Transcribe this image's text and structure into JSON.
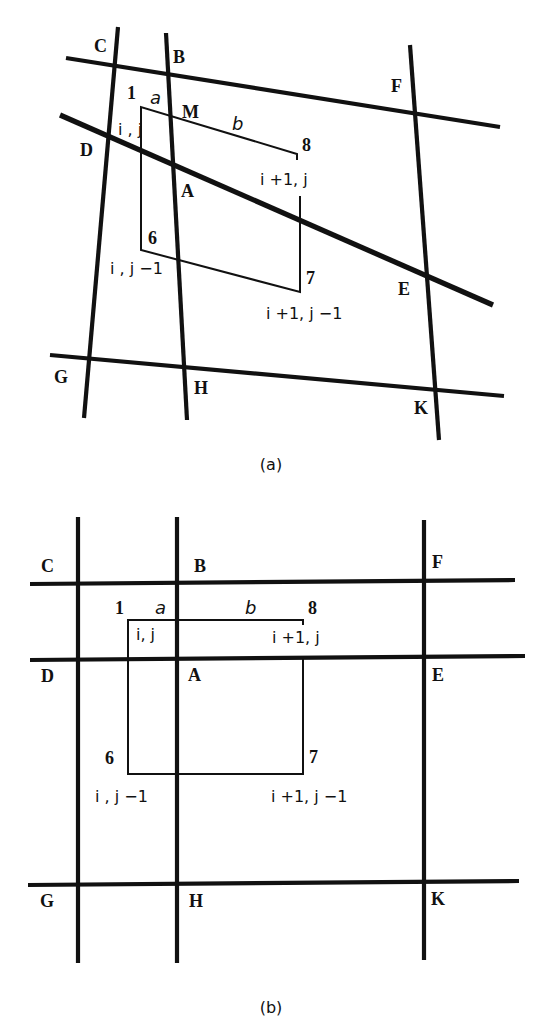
{
  "panels": [
    {
      "id": "a",
      "caption": "(a)",
      "caption_pos": [
        271,
        470
      ],
      "heavy_lines": [
        {
          "name": "grid-line-CD-vertical",
          "x1": 118,
          "y1": 27,
          "x2": 84,
          "y2": 418
        },
        {
          "name": "grid-line-BAH-vertical",
          "x1": 166,
          "y1": 33,
          "x2": 187,
          "y2": 420
        },
        {
          "name": "grid-line-FEK-vertical",
          "x1": 410,
          "y1": 45,
          "x2": 439,
          "y2": 440
        },
        {
          "name": "grid-line-CBF-horizontal",
          "x1": 66,
          "y1": 58,
          "x2": 500,
          "y2": 127
        },
        {
          "name": "grid-line-DAE-horizontal",
          "x1": 60,
          "y1": 115,
          "x2": 493,
          "y2": 305,
          "thick": true
        },
        {
          "name": "grid-line-GHK-horizontal",
          "x1": 50,
          "y1": 355,
          "x2": 504,
          "y2": 396
        }
      ],
      "thin_polyline": [
        [
          141,
          142
        ],
        [
          141,
          107
        ],
        [
          297,
          154
        ],
        [
          297,
          160
        ]
      ],
      "thin_polyline_2": [
        [
          141,
          142
        ],
        [
          141,
          250
        ],
        [
          300,
          292
        ],
        [
          300,
          196
        ]
      ],
      "point_labels": [
        {
          "text": "C",
          "x": 94,
          "y": 52
        },
        {
          "text": "B",
          "x": 173,
          "y": 63
        },
        {
          "text": "F",
          "x": 391,
          "y": 92
        },
        {
          "text": "M",
          "x": 182,
          "y": 118
        },
        {
          "text": "D",
          "x": 80,
          "y": 156
        },
        {
          "text": "A",
          "x": 181,
          "y": 197
        },
        {
          "text": "E",
          "x": 398,
          "y": 295
        },
        {
          "text": "G",
          "x": 54,
          "y": 383
        },
        {
          "text": "H",
          "x": 194,
          "y": 394
        },
        {
          "text": "K",
          "x": 414,
          "y": 414
        }
      ],
      "node_numbers": [
        {
          "text": "1",
          "x": 127,
          "y": 99
        },
        {
          "text": "8",
          "x": 302,
          "y": 151
        },
        {
          "text": "6",
          "x": 148,
          "y": 244
        },
        {
          "text": "7",
          "x": 306,
          "y": 284
        }
      ],
      "index_labels": [
        {
          "text": "i , j",
          "x": 118,
          "y": 135
        },
        {
          "text": "i +1, j",
          "x": 260,
          "y": 185
        },
        {
          "text": "i , j −1",
          "x": 110,
          "y": 274
        },
        {
          "text": "i +1, j −1",
          "x": 266,
          "y": 319
        }
      ],
      "length_labels": [
        {
          "text": "a",
          "x": 150,
          "y": 104
        },
        {
          "text": "b",
          "x": 232,
          "y": 130
        }
      ]
    },
    {
      "id": "b",
      "caption": "(b)",
      "caption_pos": [
        271,
        1013
      ],
      "heavy_lines": [
        {
          "name": "grid-line-CDG-vertical",
          "x1": 78,
          "y1": 517,
          "x2": 78,
          "y2": 963
        },
        {
          "name": "grid-line-BAH-vertical",
          "x1": 177,
          "y1": 517,
          "x2": 177,
          "y2": 963
        },
        {
          "name": "grid-line-FEK-vertical",
          "x1": 424,
          "y1": 520,
          "x2": 424,
          "y2": 960
        },
        {
          "name": "grid-line-CBF-horizontal",
          "x1": 30,
          "y1": 584,
          "x2": 515,
          "y2": 580
        },
        {
          "name": "grid-line-DAE-horizontal",
          "x1": 30,
          "y1": 660,
          "x2": 525,
          "y2": 656
        },
        {
          "name": "grid-line-GHK-horizontal",
          "x1": 28,
          "y1": 885,
          "x2": 519,
          "y2": 881
        }
      ],
      "thin_polyline": [
        [
          128,
          659
        ],
        [
          128,
          620
        ],
        [
          303,
          620
        ],
        [
          303,
          625
        ]
      ],
      "thin_polyline_2": [
        [
          128,
          659
        ],
        [
          128,
          774
        ],
        [
          303,
          774
        ],
        [
          303,
          659
        ]
      ],
      "point_labels": [
        {
          "text": "C",
          "x": 41,
          "y": 572
        },
        {
          "text": "B",
          "x": 194,
          "y": 572
        },
        {
          "text": "F",
          "x": 432,
          "y": 568
        },
        {
          "text": "D",
          "x": 41,
          "y": 682
        },
        {
          "text": "A",
          "x": 188,
          "y": 681
        },
        {
          "text": "E",
          "x": 432,
          "y": 681
        },
        {
          "text": "G",
          "x": 40,
          "y": 907
        },
        {
          "text": "H",
          "x": 189,
          "y": 907
        },
        {
          "text": "K",
          "x": 431,
          "y": 905
        }
      ],
      "node_numbers": [
        {
          "text": "1",
          "x": 115,
          "y": 614
        },
        {
          "text": "8",
          "x": 308,
          "y": 614
        },
        {
          "text": "6",
          "x": 105,
          "y": 764
        },
        {
          "text": "7",
          "x": 309,
          "y": 763
        }
      ],
      "index_labels": [
        {
          "text": "i, j",
          "x": 136,
          "y": 640
        },
        {
          "text": "i +1, j",
          "x": 272,
          "y": 643
        },
        {
          "text": "i , j −1",
          "x": 95,
          "y": 802
        },
        {
          "text": "i +1, j −1",
          "x": 271,
          "y": 802
        }
      ],
      "length_labels": [
        {
          "text": "a",
          "x": 155,
          "y": 614
        },
        {
          "text": "b",
          "x": 245,
          "y": 614
        }
      ]
    }
  ]
}
